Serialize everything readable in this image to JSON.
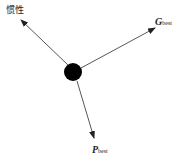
{
  "diagram": {
    "title": "",
    "node": {
      "shape": "circle",
      "cx": 73,
      "cy": 72,
      "r": 9,
      "color": "#000000"
    },
    "arrows": [
      {
        "name": "inertia",
        "x1": 68,
        "y1": 65,
        "x2": 21,
        "y2": 20
      },
      {
        "name": "gbest",
        "x1": 81,
        "y1": 68,
        "x2": 155,
        "y2": 28
      },
      {
        "name": "pbest",
        "x1": 77,
        "y1": 81,
        "x2": 94,
        "y2": 138
      }
    ],
    "labels": {
      "inertia": "惯性",
      "gbest_main": "G",
      "gbest_sub": "best",
      "pbest_main": "P",
      "pbest_sub": "best"
    },
    "line_color": "#444444"
  }
}
